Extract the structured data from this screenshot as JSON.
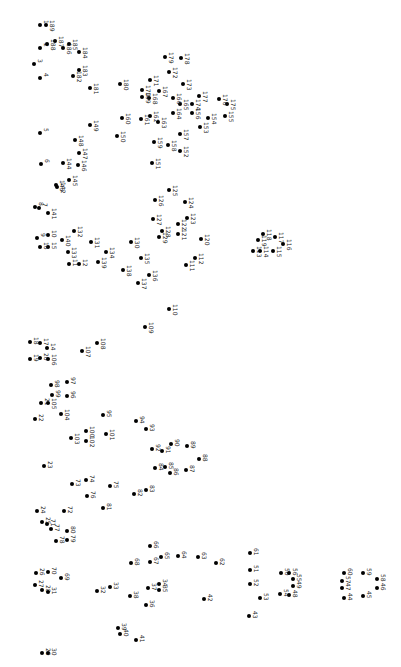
{
  "puzzle": {
    "type": "connect-the-dots",
    "orientation": "rotated 90deg clockwise",
    "dot_color": "#000000",
    "background": "#ffffff",
    "points": [
      {
        "n": "1",
        "x": 40,
        "y": 25
      },
      {
        "n": "2",
        "x": 40,
        "y": 48
      },
      {
        "n": "3",
        "x": 34,
        "y": 64
      },
      {
        "n": "4",
        "x": 40,
        "y": 78
      },
      {
        "n": "5",
        "x": 40,
        "y": 133
      },
      {
        "n": "6",
        "x": 41,
        "y": 164
      },
      {
        "n": "7",
        "x": 39,
        "y": 208
      },
      {
        "n": "8",
        "x": 35,
        "y": 207
      },
      {
        "n": "9",
        "x": 37,
        "y": 238
      },
      {
        "n": "10",
        "x": 48,
        "y": 235
      },
      {
        "n": "15",
        "x": 48,
        "y": 247
      },
      {
        "n": "16",
        "x": 40,
        "y": 247
      },
      {
        "n": "11",
        "x": 69,
        "y": 264
      },
      {
        "n": "12",
        "x": 79,
        "y": 264
      },
      {
        "n": "14",
        "x": 47,
        "y": 348
      },
      {
        "n": "17",
        "x": 40,
        "y": 343
      },
      {
        "n": "18",
        "x": 30,
        "y": 342
      },
      {
        "n": "19",
        "x": 30,
        "y": 359
      },
      {
        "n": "20",
        "x": 40,
        "y": 358
      },
      {
        "n": "21",
        "x": 41,
        "y": 403
      },
      {
        "n": "22",
        "x": 35,
        "y": 419
      },
      {
        "n": "23",
        "x": 44,
        "y": 466
      },
      {
        "n": "24",
        "x": 37,
        "y": 511
      },
      {
        "n": "25",
        "x": 42,
        "y": 522
      },
      {
        "n": "26",
        "x": 36,
        "y": 573
      },
      {
        "n": "27",
        "x": 35,
        "y": 585
      },
      {
        "n": "28",
        "x": 42,
        "y": 590
      },
      {
        "n": "29",
        "x": 42,
        "y": 653
      },
      {
        "n": "30",
        "x": 48,
        "y": 653
      },
      {
        "n": "31",
        "x": 48,
        "y": 592
      },
      {
        "n": "32",
        "x": 97,
        "y": 591
      },
      {
        "n": "33",
        "x": 110,
        "y": 587
      },
      {
        "n": "34",
        "x": 159,
        "y": 584
      },
      {
        "n": "35",
        "x": 159,
        "y": 590
      },
      {
        "n": "36",
        "x": 146,
        "y": 605
      },
      {
        "n": "37",
        "x": 148,
        "y": 588
      },
      {
        "n": "38",
        "x": 130,
        "y": 596
      },
      {
        "n": "39",
        "x": 118,
        "y": 628
      },
      {
        "n": "40",
        "x": 120,
        "y": 634
      },
      {
        "n": "41",
        "x": 136,
        "y": 640
      },
      {
        "n": "42",
        "x": 204,
        "y": 599
      },
      {
        "n": "43",
        "x": 249,
        "y": 616
      },
      {
        "n": "44",
        "x": 344,
        "y": 598
      },
      {
        "n": "45",
        "x": 363,
        "y": 596
      },
      {
        "n": "46",
        "x": 377,
        "y": 588
      },
      {
        "n": "47",
        "x": 342,
        "y": 588
      },
      {
        "n": "48",
        "x": 289,
        "y": 595
      },
      {
        "n": "49",
        "x": 293,
        "y": 586
      },
      {
        "n": "50",
        "x": 281,
        "y": 573
      },
      {
        "n": "51",
        "x": 250,
        "y": 570
      },
      {
        "n": "52",
        "x": 250,
        "y": 584
      },
      {
        "n": "53",
        "x": 260,
        "y": 598
      },
      {
        "n": "54",
        "x": 280,
        "y": 594
      },
      {
        "n": "55",
        "x": 293,
        "y": 579
      },
      {
        "n": "56",
        "x": 289,
        "y": 573
      },
      {
        "n": "57",
        "x": 342,
        "y": 581
      },
      {
        "n": "58",
        "x": 377,
        "y": 579
      },
      {
        "n": "59",
        "x": 363,
        "y": 573
      },
      {
        "n": "60",
        "x": 344,
        "y": 573
      },
      {
        "n": "61",
        "x": 250,
        "y": 553
      },
      {
        "n": "62",
        "x": 216,
        "y": 563
      },
      {
        "n": "63",
        "x": 198,
        "y": 557
      },
      {
        "n": "64",
        "x": 178,
        "y": 556
      },
      {
        "n": "65",
        "x": 161,
        "y": 557
      },
      {
        "n": "66",
        "x": 150,
        "y": 546
      },
      {
        "n": "67",
        "x": 150,
        "y": 562
      },
      {
        "n": "68",
        "x": 131,
        "y": 563
      },
      {
        "n": "69",
        "x": 61,
        "y": 578
      },
      {
        "n": "70",
        "x": 48,
        "y": 572
      },
      {
        "n": "71",
        "x": 47,
        "y": 524
      },
      {
        "n": "72",
        "x": 64,
        "y": 511
      },
      {
        "n": "73",
        "x": 72,
        "y": 484
      },
      {
        "n": "74",
        "x": 86,
        "y": 480
      },
      {
        "n": "75",
        "x": 110,
        "y": 486
      },
      {
        "n": "76",
        "x": 87,
        "y": 496
      },
      {
        "n": "77",
        "x": 51,
        "y": 529
      },
      {
        "n": "78",
        "x": 56,
        "y": 541
      },
      {
        "n": "79",
        "x": 67,
        "y": 540
      },
      {
        "n": "80",
        "x": 67,
        "y": 531
      },
      {
        "n": "81",
        "x": 103,
        "y": 508
      },
      {
        "n": "82",
        "x": 134,
        "y": 494
      },
      {
        "n": "83",
        "x": 146,
        "y": 490
      },
      {
        "n": "84",
        "x": 155,
        "y": 468
      },
      {
        "n": "85",
        "x": 165,
        "y": 467
      },
      {
        "n": "86",
        "x": 170,
        "y": 473
      },
      {
        "n": "87",
        "x": 186,
        "y": 470
      },
      {
        "n": "88",
        "x": 199,
        "y": 459
      },
      {
        "n": "89",
        "x": 187,
        "y": 446
      },
      {
        "n": "90",
        "x": 171,
        "y": 444
      },
      {
        "n": "91",
        "x": 162,
        "y": 451
      },
      {
        "n": "92",
        "x": 152,
        "y": 449
      },
      {
        "n": "93",
        "x": 146,
        "y": 429
      },
      {
        "n": "94",
        "x": 136,
        "y": 421
      },
      {
        "n": "95",
        "x": 103,
        "y": 415
      },
      {
        "n": "96",
        "x": 67,
        "y": 396
      },
      {
        "n": "97",
        "x": 67,
        "y": 382
      },
      {
        "n": "98",
        "x": 51,
        "y": 385
      },
      {
        "n": "99",
        "x": 52,
        "y": 395
      },
      {
        "n": "100",
        "x": 86,
        "y": 431
      },
      {
        "n": "101",
        "x": 106,
        "y": 434
      },
      {
        "n": "102",
        "x": 86,
        "y": 441
      },
      {
        "n": "103",
        "x": 71,
        "y": 438
      },
      {
        "n": "104",
        "x": 61,
        "y": 414
      },
      {
        "n": "105",
        "x": 48,
        "y": 403
      },
      {
        "n": "106",
        "x": 48,
        "y": 359
      },
      {
        "n": "107",
        "x": 82,
        "y": 351
      },
      {
        "n": "108",
        "x": 97,
        "y": 343
      },
      {
        "n": "109",
        "x": 145,
        "y": 327
      },
      {
        "n": "110",
        "x": 169,
        "y": 309
      },
      {
        "n": "111",
        "x": 186,
        "y": 265
      },
      {
        "n": "112",
        "x": 195,
        "y": 258
      },
      {
        "n": "113",
        "x": 253,
        "y": 251
      },
      {
        "n": "114",
        "x": 260,
        "y": 251
      },
      {
        "n": "115",
        "x": 273,
        "y": 251
      },
      {
        "n": "116",
        "x": 283,
        "y": 244
      },
      {
        "n": "117",
        "x": 275,
        "y": 237
      },
      {
        "n": "118",
        "x": 263,
        "y": 234
      },
      {
        "n": "119",
        "x": 258,
        "y": 240
      },
      {
        "n": "120",
        "x": 201,
        "y": 239
      },
      {
        "n": "121",
        "x": 178,
        "y": 234
      },
      {
        "n": "122",
        "x": 178,
        "y": 224
      },
      {
        "n": "123",
        "x": 187,
        "y": 218
      },
      {
        "n": "124",
        "x": 185,
        "y": 202
      },
      {
        "n": "125",
        "x": 169,
        "y": 190
      },
      {
        "n": "126",
        "x": 155,
        "y": 200
      },
      {
        "n": "127",
        "x": 153,
        "y": 219
      },
      {
        "n": "128",
        "x": 162,
        "y": 231
      },
      {
        "n": "129",
        "x": 159,
        "y": 237
      },
      {
        "n": "130",
        "x": 131,
        "y": 242
      },
      {
        "n": "131",
        "x": 91,
        "y": 242
      },
      {
        "n": "132",
        "x": 74,
        "y": 231
      },
      {
        "n": "133",
        "x": 68,
        "y": 252
      },
      {
        "n": "134",
        "x": 106,
        "y": 252
      },
      {
        "n": "135",
        "x": 141,
        "y": 258
      },
      {
        "n": "136",
        "x": 149,
        "y": 275
      },
      {
        "n": "137",
        "x": 138,
        "y": 283
      },
      {
        "n": "138",
        "x": 123,
        "y": 270
      },
      {
        "n": "139",
        "x": 98,
        "y": 262
      },
      {
        "n": "140",
        "x": 62,
        "y": 240
      },
      {
        "n": "141",
        "x": 48,
        "y": 213
      },
      {
        "n": "142",
        "x": 57,
        "y": 187
      },
      {
        "n": "143",
        "x": 56,
        "y": 185
      },
      {
        "n": "144",
        "x": 63,
        "y": 163
      },
      {
        "n": "145",
        "x": 69,
        "y": 180
      },
      {
        "n": "146",
        "x": 78,
        "y": 165
      },
      {
        "n": "147",
        "x": 79,
        "y": 153
      },
      {
        "n": "148",
        "x": 75,
        "y": 140
      },
      {
        "n": "149",
        "x": 90,
        "y": 125
      },
      {
        "n": "150",
        "x": 117,
        "y": 136
      },
      {
        "n": "151",
        "x": 152,
        "y": 163
      },
      {
        "n": "152",
        "x": 180,
        "y": 151
      },
      {
        "n": "153",
        "x": 200,
        "y": 127
      },
      {
        "n": "154",
        "x": 208,
        "y": 118
      },
      {
        "n": "155",
        "x": 225,
        "y": 116
      },
      {
        "n": "156",
        "x": 192,
        "y": 113
      },
      {
        "n": "157",
        "x": 180,
        "y": 134
      },
      {
        "n": "158",
        "x": 168,
        "y": 145
      },
      {
        "n": "159",
        "x": 154,
        "y": 142
      },
      {
        "n": "160",
        "x": 122,
        "y": 118
      },
      {
        "n": "161",
        "x": 141,
        "y": 119
      },
      {
        "n": "162",
        "x": 150,
        "y": 116
      },
      {
        "n": "163",
        "x": 158,
        "y": 122
      },
      {
        "n": "164",
        "x": 173,
        "y": 113
      },
      {
        "n": "165",
        "x": 180,
        "y": 104
      },
      {
        "n": "166",
        "x": 173,
        "y": 98
      },
      {
        "n": "167",
        "x": 159,
        "y": 91
      },
      {
        "n": "168",
        "x": 149,
        "y": 98
      },
      {
        "n": "169",
        "x": 142,
        "y": 97
      },
      {
        "n": "170",
        "x": 142,
        "y": 90
      },
      {
        "n": "171",
        "x": 150,
        "y": 80
      },
      {
        "n": "172",
        "x": 169,
        "y": 72
      },
      {
        "n": "173",
        "x": 183,
        "y": 84
      },
      {
        "n": "174",
        "x": 192,
        "y": 104
      },
      {
        "n": "175",
        "x": 227,
        "y": 104
      },
      {
        "n": "176",
        "x": 219,
        "y": 99
      },
      {
        "n": "177",
        "x": 199,
        "y": 96
      },
      {
        "n": "178",
        "x": 181,
        "y": 58
      },
      {
        "n": "179",
        "x": 165,
        "y": 57
      },
      {
        "n": "180",
        "x": 120,
        "y": 84
      },
      {
        "n": "181",
        "x": 90,
        "y": 88
      },
      {
        "n": "182",
        "x": 73,
        "y": 76
      },
      {
        "n": "183",
        "x": 79,
        "y": 70
      },
      {
        "n": "184",
        "x": 79,
        "y": 52
      },
      {
        "n": "185",
        "x": 69,
        "y": 44
      },
      {
        "n": "186",
        "x": 63,
        "y": 48
      },
      {
        "n": "187",
        "x": 55,
        "y": 41
      },
      {
        "n": "188",
        "x": 47,
        "y": 44
      },
      {
        "n": "189",
        "x": 46,
        "y": 25
      }
    ]
  }
}
